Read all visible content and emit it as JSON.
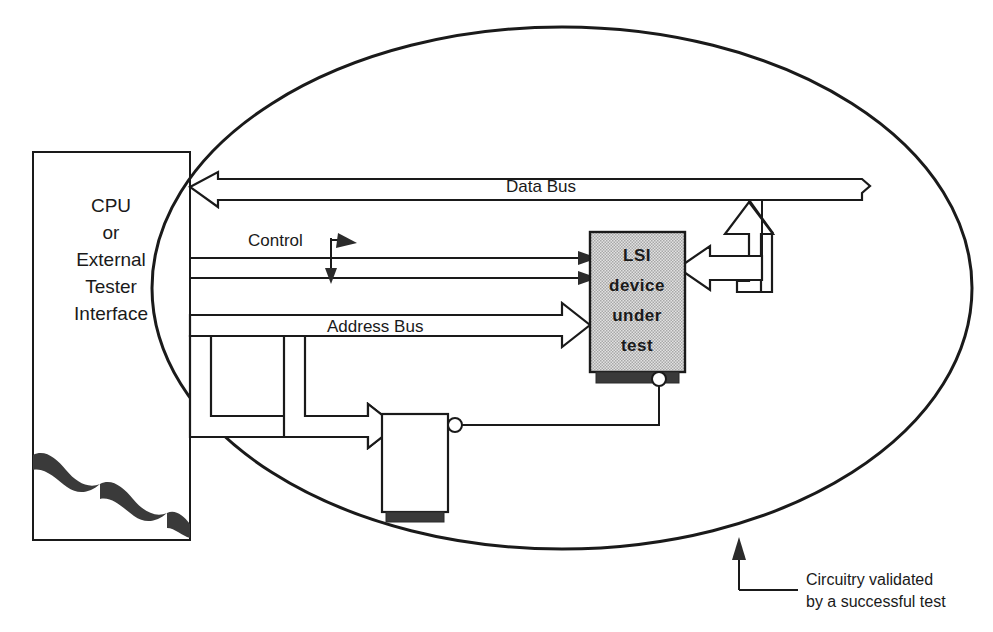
{
  "figure": {
    "type": "block-diagram",
    "background_color": "#ffffff",
    "line_color": "#1a1a1a",
    "chip_fill_color": "#d0d0d0",
    "chip_base_color": "#3a3a3a"
  },
  "blocks": {
    "cpu": {
      "label_lines": [
        "CPU",
        "or",
        "External",
        "Tester",
        "Interface"
      ],
      "shape": "torn-page-rectangle"
    },
    "lsi": {
      "label_lines": [
        "LSI",
        "device",
        "under",
        "test"
      ],
      "shape": "hatched-chip"
    },
    "support": {
      "label_lines": [],
      "shape": "plain-chip"
    }
  },
  "signals": {
    "data_bus": {
      "label": "Data  Bus",
      "style": "hollow-block-arrow",
      "direction": "right-to-left",
      "has_break_symbol": true
    },
    "control": {
      "label": "Control",
      "style": "thin-line-arrow",
      "direction": "left-to-right",
      "line_count": 2
    },
    "address_bus": {
      "label": "Address Bus",
      "style": "hollow-block-arrow",
      "direction": "left-to-right",
      "branches": 1
    }
  },
  "annotations": {
    "boundary": {
      "shape": "ellipse",
      "caption_lines": [
        "Circuitry validated",
        "by a successful test"
      ],
      "leader": "elbow-with-arrowhead"
    }
  }
}
